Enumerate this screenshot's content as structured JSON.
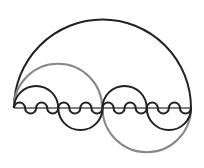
{
  "diagram": {
    "type": "geometric-semicircle-construction",
    "colors": {
      "primary_stroke": "#222222",
      "secondary_stroke": "#888888",
      "baseline": "#555555",
      "background": "#ffffff"
    },
    "baseline": {
      "x1": 14,
      "x2": 191,
      "y": 108
    },
    "large_semicircle": {
      "cx": 102.5,
      "cy": 108,
      "r": 88.5,
      "side": "up"
    },
    "gray_arcs": [
      {
        "cx": 58,
        "cy": 108,
        "r": 44.25,
        "side": "up"
      },
      {
        "cx": 146.75,
        "cy": 108,
        "r": 44.25,
        "side": "down"
      }
    ],
    "medium_semicircles": [
      {
        "cx": 36.1,
        "side": "up"
      },
      {
        "cx": 80.4,
        "side": "down"
      },
      {
        "cx": 124.6,
        "side": "up"
      },
      {
        "cx": 168.9,
        "side": "down"
      }
    ],
    "small_wave_count": 8
  }
}
